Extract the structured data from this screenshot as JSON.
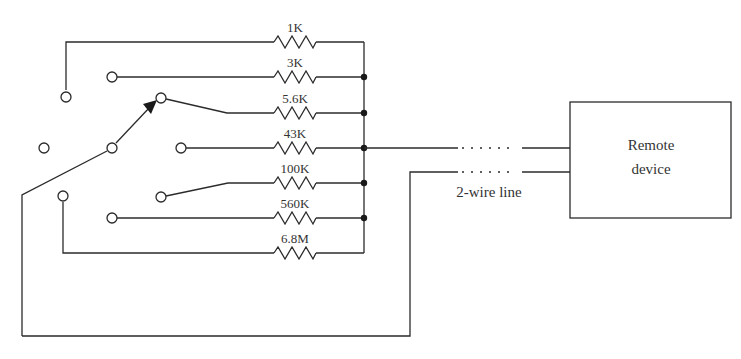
{
  "diagram": {
    "type": "circuit-schematic",
    "resistors": [
      {
        "label": "1K",
        "y": 42
      },
      {
        "label": "3K",
        "y": 77
      },
      {
        "label": "5.6K",
        "y": 113
      },
      {
        "label": "43K",
        "y": 148
      },
      {
        "label": "100K",
        "y": 183
      },
      {
        "label": "560K",
        "y": 218
      },
      {
        "label": "6.8M",
        "y": 253
      }
    ],
    "remote_device": {
      "line1": "Remote",
      "line2": "device"
    },
    "line_label": "2-wire line",
    "colors": {
      "ink": "#2b2b2b",
      "background": "#ffffff"
    }
  }
}
